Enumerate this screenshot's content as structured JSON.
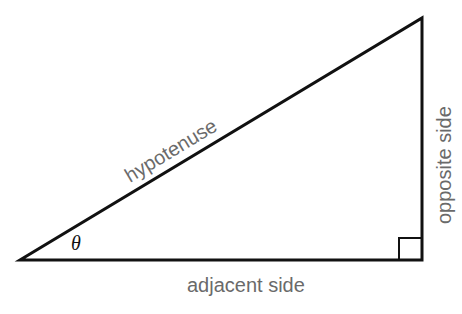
{
  "diagram": {
    "type": "right-triangle",
    "vertices": {
      "angle_vertex": [
        20,
        260
      ],
      "right_angle_vertex": [
        422,
        260
      ],
      "top_vertex": [
        422,
        18
      ]
    },
    "stroke_color": "#111111",
    "label_color": "#6a6a6a",
    "labels": {
      "hypotenuse": "hypotenuse",
      "adjacent": "adjacent side",
      "opposite": "opposite side",
      "angle": "θ"
    },
    "right_angle_marker_size": 23
  }
}
